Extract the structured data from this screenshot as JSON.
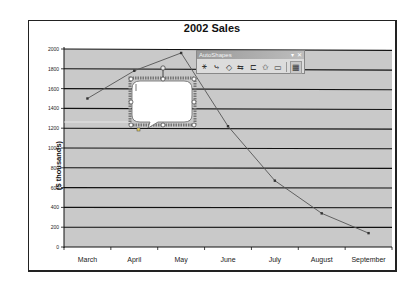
{
  "chart_data": {
    "type": "line",
    "title": "2002 Sales",
    "xlabel": "",
    "ylabel": "($ thousands)",
    "categories": [
      "March",
      "April",
      "May",
      "June",
      "July",
      "August",
      "September"
    ],
    "series": [
      {
        "name": "Sales",
        "values": [
          1500,
          1780,
          1960,
          1220,
          670,
          340,
          140
        ]
      }
    ],
    "ylim": [
      0,
      2000
    ],
    "yticks": [
      0,
      200,
      400,
      600,
      800,
      1000,
      1200,
      1400,
      1600,
      1800,
      2000
    ],
    "grid": true,
    "legend": "none",
    "plot_background": "#c9c9c9",
    "line_color": "#555555"
  },
  "toolbar": {
    "title": "AutoShapes",
    "minimize_label": "▾",
    "close_label": "✕",
    "icons": [
      {
        "name": "lines",
        "glyph": "⚹"
      },
      {
        "name": "connectors",
        "glyph": "⤷"
      },
      {
        "name": "basic-shapes",
        "glyph": "◇"
      },
      {
        "name": "block-arrows",
        "glyph": "⇆"
      },
      {
        "name": "flowchart",
        "glyph": "⊏"
      },
      {
        "name": "stars-and-banners",
        "glyph": "✩"
      },
      {
        "name": "callouts",
        "glyph": "▭"
      },
      {
        "name": "more-autoshapes",
        "glyph": "▦"
      }
    ]
  },
  "callout": {
    "text": ""
  }
}
